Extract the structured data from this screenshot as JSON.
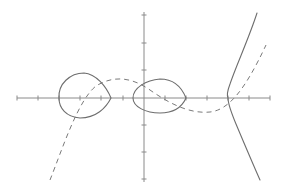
{
  "figure": {
    "colors": {
      "background": "#ffffff",
      "axis": "#8a8a8a",
      "solid_curve": "#6e6e6e",
      "dashed_curve": "#7a7a7a"
    },
    "axes": {
      "x_axis": {
        "y": 98,
        "x_start": 17,
        "x_end": 270,
        "ticks": [
          17,
          38,
          59,
          80,
          101,
          123,
          165,
          186,
          207,
          228,
          249,
          270
        ]
      },
      "y_axis": {
        "x": 144,
        "y_start": 12,
        "y_end": 182,
        "ticks": [
          15,
          43,
          70,
          125,
          152,
          179
        ]
      },
      "origin": {
        "x": 144,
        "y": 98
      },
      "tick_labels": []
    },
    "curves": {
      "left_oval": {
        "style": "solid",
        "path": "M59,98 C58,84 70,73 84,73 C96,74 106,86 111,98 C106,108 96,118 80,118 C66,117 59,108 59,98 Z"
      },
      "middle_oval": {
        "style": "solid",
        "path": "M133,98 C133,88 146,80 160,79 C174,79 182,88 186,98 C182,107 174,113 160,113 C146,113 133,107 133,98 Z"
      },
      "right_branch": {
        "style": "solid",
        "path": "M257,13 C249,38 236,66 230,84 C227,92 227,96 228,98 C228,104 231,112 236,124 C244,143 252,162 260,180"
      },
      "dashed_cubic": {
        "style": "dashed",
        "path": "M50,180 C62,150 78,100 96,86 C112,76 130,76 150,90 C170,104 190,114 210,112 C228,110 244,92 266,45"
      }
    },
    "text_labels": []
  }
}
